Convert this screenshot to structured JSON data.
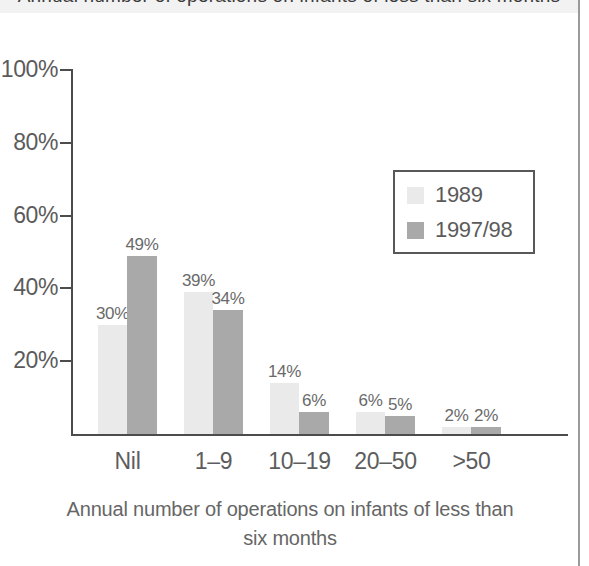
{
  "figure": {
    "title_partial": "Annual number of operations on infants of less than six months",
    "xaxis_title_line1": "Annual number of operations on infants of less than",
    "xaxis_title_line2": "six months"
  },
  "legend": {
    "items": [
      {
        "label": "1989",
        "color": "#eaeaea"
      },
      {
        "label": "1997/98",
        "color": "#a9a9a9"
      }
    ]
  },
  "axis": {
    "y_ticks": [
      "100%",
      "80%",
      "60%",
      "40%",
      "20%"
    ],
    "x_categories": [
      "Nil",
      "1–9",
      "10–19",
      "20–50",
      ">50"
    ]
  },
  "values": {
    "s1989": [
      "30%",
      "39%",
      "14%",
      "6%",
      "2%"
    ],
    "s199798": [
      "49%",
      "34%",
      "6%",
      "5%",
      "2%"
    ]
  },
  "chart_data": {
    "type": "bar",
    "title": "Annual number of operations on infants of less than six months",
    "xlabel": "Annual number of operations on infants of less than six months",
    "ylabel": "",
    "categories": [
      "Nil",
      "1–9",
      "10–19",
      "20–50",
      ">50"
    ],
    "series": [
      {
        "name": "1989",
        "color": "#eaeaea",
        "values": [
          30,
          39,
          14,
          6,
          2
        ]
      },
      {
        "name": "1997/98",
        "color": "#a9a9a9",
        "values": [
          49,
          34,
          6,
          5,
          2
        ]
      }
    ],
    "ylim": [
      0,
      100
    ],
    "yticks": [
      0,
      20,
      40,
      60,
      80,
      100
    ],
    "ytick_labels": [
      "0%",
      "20%",
      "40%",
      "60%",
      "80%",
      "100%"
    ],
    "value_label_suffix": "%",
    "grid": false,
    "legend_position": "upper right",
    "orientation": "vertical",
    "grouped": true
  }
}
